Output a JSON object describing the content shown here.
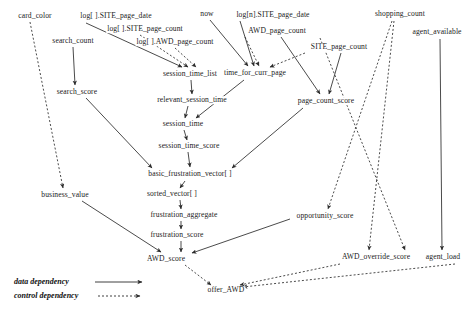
{
  "diagram": {
    "width": 475,
    "height": 317,
    "background": "#ffffff",
    "edge_color": "#2b2b2b",
    "text_color": "#1a1a1a"
  },
  "legend": {
    "items": [
      {
        "label": "data dependency",
        "style": "solid",
        "x": 14,
        "y": 282
      },
      {
        "label": "control dependency",
        "style": "dashed",
        "x": 14,
        "y": 296
      }
    ]
  },
  "nodes": [
    {
      "id": "card_color",
      "label": "card_color",
      "x": 35,
      "y": 16
    },
    {
      "id": "log_site_page_date",
      "label": "log[ ].SITE_page_date",
      "x": 116,
      "y": 16
    },
    {
      "id": "now",
      "label": "now",
      "x": 207,
      "y": 14
    },
    {
      "id": "log_n_site_page_date",
      "label": "log[n].SITE_page_date",
      "x": 273,
      "y": 15
    },
    {
      "id": "shopping_count",
      "label": "shopping_count",
      "x": 400,
      "y": 14
    },
    {
      "id": "log_site_page_count",
      "label": "log[ ].SITE_page_count",
      "x": 145,
      "y": 29
    },
    {
      "id": "awd_page_count",
      "label": "AWD_page_count",
      "x": 277,
      "y": 31
    },
    {
      "id": "agent_available",
      "label": "agent_available",
      "x": 437,
      "y": 32
    },
    {
      "id": "search_count",
      "label": "search_count",
      "x": 73,
      "y": 41
    },
    {
      "id": "log_awd_page_count",
      "label": "log[ ].AWD_page_count",
      "x": 175,
      "y": 42
    },
    {
      "id": "site_page_count",
      "label": "SITE_page_count",
      "x": 339,
      "y": 47
    },
    {
      "id": "session_time_list",
      "label": "session_time_list",
      "x": 190,
      "y": 74
    },
    {
      "id": "time_for_curr_page",
      "label": "time_for_curr_page",
      "x": 255,
      "y": 73
    },
    {
      "id": "search_score",
      "label": "search_score",
      "x": 77,
      "y": 92
    },
    {
      "id": "relevant_session_time",
      "label": "relevant_session_time",
      "x": 192,
      "y": 100
    },
    {
      "id": "page_count_score",
      "label": "page_count_score",
      "x": 326,
      "y": 101
    },
    {
      "id": "session_time",
      "label": "session_time",
      "x": 183,
      "y": 124
    },
    {
      "id": "session_time_score",
      "label": "session_time_score",
      "x": 189,
      "y": 146
    },
    {
      "id": "basic_frustration_vector",
      "label": "basic_frustration_vector[ ]",
      "x": 190,
      "y": 174
    },
    {
      "id": "business_value",
      "label": "business_value",
      "x": 65,
      "y": 195
    },
    {
      "id": "sorted_vector",
      "label": "sorted_vector[ ]",
      "x": 172,
      "y": 194
    },
    {
      "id": "frustration_aggregate",
      "label": "frustration_aggregate",
      "x": 184,
      "y": 215
    },
    {
      "id": "opportunity_score",
      "label": "opportunity_score",
      "x": 325,
      "y": 216
    },
    {
      "id": "frustration_score",
      "label": "frustration_score",
      "x": 177,
      "y": 235
    },
    {
      "id": "awd_score",
      "label": "AWD_score",
      "x": 166,
      "y": 259
    },
    {
      "id": "awd_override_score",
      "label": "AWD_override_score",
      "x": 376,
      "y": 257
    },
    {
      "id": "agent_load",
      "label": "agent_load",
      "x": 443,
      "y": 257
    },
    {
      "id": "offer_awd",
      "label": "offer_AWD",
      "x": 226,
      "y": 290
    }
  ],
  "edges": [
    {
      "from": "card_color",
      "to": "business_value",
      "type": "control",
      "path": "M30,22 L63,188"
    },
    {
      "from": "search_count",
      "to": "search_score",
      "type": "data",
      "path": "M73,47 L75,85"
    },
    {
      "from": "log_site_page_date",
      "to": "session_time_list",
      "type": "data",
      "path": "M86,23 L182,67"
    },
    {
      "from": "log_site_page_count",
      "to": "session_time_list",
      "type": "control",
      "path": "M140,35 L188,67"
    },
    {
      "from": "log_awd_page_count",
      "to": "session_time_list",
      "type": "control",
      "path": "M175,48 L196,67"
    },
    {
      "from": "now",
      "to": "time_for_curr_page",
      "type": "data",
      "path": "M210,20 L248,66"
    },
    {
      "from": "log_n_site_page_date",
      "to": "time_for_curr_page",
      "type": "data",
      "path": "M240,21 L254,66"
    },
    {
      "from": "awd_page_count",
      "to": "time_for_curr_page",
      "type": "control",
      "path": "M245,37 L259,66"
    },
    {
      "from": "site_page_count",
      "to": "time_for_curr_page",
      "type": "control",
      "path": "M305,53 L270,67"
    },
    {
      "from": "awd_page_count",
      "to": "page_count_score",
      "type": "data",
      "path": "M281,37 L320,94"
    },
    {
      "from": "site_page_count",
      "to": "page_count_score",
      "type": "data",
      "path": "M341,53 L329,94"
    },
    {
      "from": "session_time_list",
      "to": "relevant_session_time",
      "type": "data",
      "path": "M191,80 L192,94"
    },
    {
      "from": "time_for_curr_page",
      "to": "session_time",
      "type": "data",
      "path": "M244,80 L196,118"
    },
    {
      "from": "relevant_session_time",
      "to": "session_time",
      "type": "data",
      "path": "M188,106 L185,118"
    },
    {
      "from": "session_time",
      "to": "session_time_score",
      "type": "data",
      "path": "M184,130 L187,140"
    },
    {
      "from": "session_time_score",
      "to": "basic_frustration_vector",
      "type": "data",
      "path": "M188,152 L190,167"
    },
    {
      "from": "search_score",
      "to": "basic_frustration_vector",
      "type": "data",
      "path": "M86,98 L152,168"
    },
    {
      "from": "page_count_score",
      "to": "basic_frustration_vector",
      "type": "data",
      "path": "M303,108 L232,168"
    },
    {
      "from": "basic_frustration_vector",
      "to": "sorted_vector",
      "type": "data",
      "path": "M185,181 L180,188"
    },
    {
      "from": "sorted_vector",
      "to": "frustration_aggregate",
      "type": "data",
      "path": "M180,200 L181,209"
    },
    {
      "from": "frustration_aggregate",
      "to": "frustration_score",
      "type": "data",
      "path": "M181,221 L181,229"
    },
    {
      "from": "frustration_score",
      "to": "awd_score",
      "type": "data",
      "path": "M181,241 L181,252"
    },
    {
      "from": "business_value",
      "to": "awd_score",
      "type": "data",
      "path": "M82,201 L161,252"
    },
    {
      "from": "opportunity_score",
      "to": "awd_score",
      "type": "data",
      "path": "M290,219 L192,253"
    },
    {
      "from": "shopping_count",
      "to": "opportunity_score",
      "type": "control",
      "path": "M392,21 L328,209"
    },
    {
      "from": "shopping_count",
      "to": "awd_override_score",
      "type": "control",
      "path": "M394,21 L369,250"
    },
    {
      "from": "awd_page_count",
      "to": "awd_override_score",
      "type": "control",
      "path": "M320,38 L405,250"
    },
    {
      "from": "agent_available",
      "to": "agent_load",
      "type": "data",
      "path": "M440,39 L442,250"
    },
    {
      "from": "awd_score",
      "to": "offer_awd",
      "type": "control",
      "path": "M185,265 L211,285"
    },
    {
      "from": "awd_override_score",
      "to": "offer_awd",
      "type": "control",
      "path": "M340,264 L240,285"
    },
    {
      "from": "agent_load",
      "to": "offer_awd",
      "type": "control",
      "path": "M455,264 L243,287"
    }
  ]
}
